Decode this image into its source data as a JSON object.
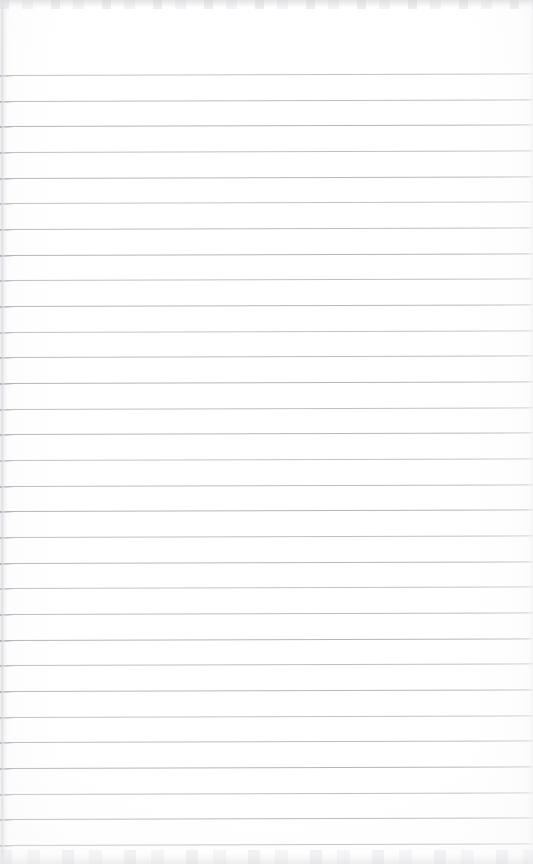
{
  "document": {
    "type": "scanned-ruled-notebook-page",
    "title": "Blank Lined Notebook Page",
    "content_text": "",
    "handwriting_present": false,
    "printed_text_present": false,
    "page_number": "",
    "header_text": "",
    "footer_text": ""
  },
  "page": {
    "width_px": 533,
    "height_px": 864,
    "background_color": "#ffffff",
    "paper_tone_color": "#fdfdfd"
  },
  "ruling": {
    "style": "horizontal-ruled",
    "line_color": "#b3b3b8",
    "line_thickness_px": 1,
    "line_count": 31,
    "first_line_y_px": 75,
    "line_spacing_px": 25.7,
    "last_line_y_px": 846,
    "left_inset_px": 0,
    "right_inset_px": 0,
    "skew_degrees": -0.18,
    "margin_rule_present": false,
    "top_margin_px": 75,
    "line_y_positions": [
      75,
      101,
      126,
      152,
      178,
      203,
      229,
      255,
      280,
      306,
      332,
      357,
      383,
      409,
      434,
      460,
      486,
      511,
      537,
      563,
      588,
      614,
      640,
      665,
      691,
      717,
      742,
      768,
      794,
      819,
      845
    ]
  },
  "scan_artifacts": {
    "top_band_color": "#e2e2e5",
    "top_band_height_px": 9,
    "bottom_band_color": "#e7e7ea",
    "bottom_band_height_px": 14,
    "left_edge_shadow_color": "#d8d8dd",
    "left_edge_width_px": 7,
    "right_edge_tone_color": "#f3f3f5",
    "right_edge_width_px": 6,
    "left_rule_tick_color": "#96969d",
    "left_rule_tick_width_px": 14
  }
}
